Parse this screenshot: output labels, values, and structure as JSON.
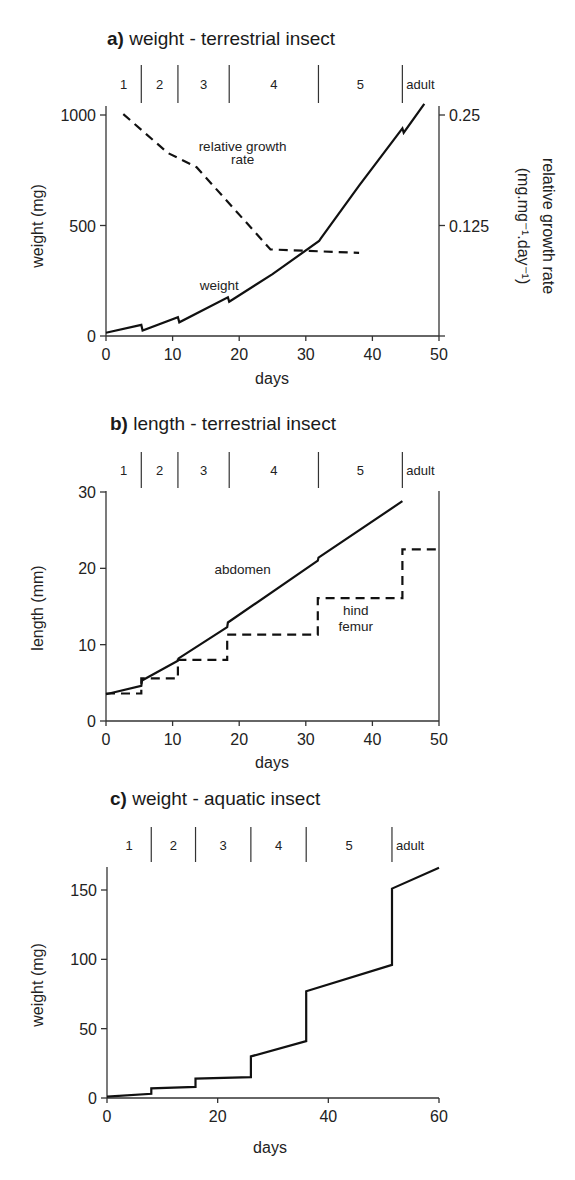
{
  "chart_data": [
    {
      "id": "a",
      "type": "line",
      "title_prefix": "a)",
      "title": "weight - terrestrial insect",
      "xlabel": "days",
      "ylabel": "weight (mg)",
      "ylabel_right": "relative growth rate",
      "ylabel_right_units": "(mg.mg⁻¹.day⁻¹)",
      "xlim": [
        0,
        50
      ],
      "ylim": [
        0,
        1000
      ],
      "ylim_right": [
        0,
        0.25
      ],
      "xticks": [
        0,
        10,
        20,
        30,
        40,
        50
      ],
      "yticks": [
        0,
        500,
        1000
      ],
      "yticks_right": [
        "0.25",
        "0.125"
      ],
      "yticks_right_values": [
        0.25,
        0.125
      ],
      "grid": false,
      "stages": [
        {
          "label": "1",
          "start": 0,
          "end": 5.3
        },
        {
          "label": "2",
          "start": 5.3,
          "end": 10.8
        },
        {
          "label": "3",
          "start": 10.8,
          "end": 18.5
        },
        {
          "label": "4",
          "start": 18.5,
          "end": 31.9
        },
        {
          "label": "5",
          "start": 31.9,
          "end": 44.5
        },
        {
          "label": "adult",
          "start": 44.5,
          "end": 50
        }
      ],
      "series": [
        {
          "name": "weight",
          "style": "solid",
          "axis": "left",
          "points": [
            [
              0,
              15
            ],
            [
              5.3,
              50
            ],
            [
              5.5,
              25
            ],
            [
              10.8,
              85
            ],
            [
              11.0,
              62
            ],
            [
              18.3,
              175
            ],
            [
              18.5,
              155
            ],
            [
              25,
              280
            ],
            [
              32.0,
              430
            ],
            [
              32.2,
              440
            ],
            [
              38,
              680
            ],
            [
              44.5,
              940
            ],
            [
              44.7,
              920
            ],
            [
              47.8,
              1050
            ]
          ]
        },
        {
          "name": "relative growth rate",
          "style": "dashed",
          "axis": "right",
          "points": [
            [
              2.6,
              0.251
            ],
            [
              9.3,
              0.207
            ],
            [
              13.6,
              0.191
            ],
            [
              24.7,
              0.098
            ],
            [
              38,
              0.094
            ]
          ]
        }
      ],
      "annotations": [
        {
          "text": "relative growth",
          "x": 20.5,
          "y": 835
        },
        {
          "text": "rate",
          "x": 20.5,
          "y": 780
        },
        {
          "text": "weight",
          "x": 17,
          "y": 210
        }
      ]
    },
    {
      "id": "b",
      "type": "line",
      "title_prefix": "b)",
      "title": "length - terrestrial insect",
      "xlabel": "days",
      "ylabel": "length (mm)",
      "xlim": [
        0,
        50
      ],
      "ylim": [
        0,
        30
      ],
      "xticks": [
        0,
        10,
        20,
        30,
        40,
        50
      ],
      "yticks": [
        0,
        10,
        20,
        30
      ],
      "grid": false,
      "stages": [
        {
          "label": "1",
          "start": 0,
          "end": 5.3
        },
        {
          "label": "2",
          "start": 5.3,
          "end": 10.8
        },
        {
          "label": "3",
          "start": 10.8,
          "end": 18.5
        },
        {
          "label": "4",
          "start": 18.5,
          "end": 31.9
        },
        {
          "label": "5",
          "start": 31.9,
          "end": 44.5
        },
        {
          "label": "adult",
          "start": 44.5,
          "end": 50
        }
      ],
      "series": [
        {
          "name": "abdomen",
          "style": "solid",
          "points": [
            [
              0,
              3.5
            ],
            [
              5.3,
              4.6
            ],
            [
              5.4,
              5.3
            ],
            [
              10.8,
              7.9
            ],
            [
              10.9,
              8.2
            ],
            [
              18.2,
              12.3
            ],
            [
              18.3,
              12.9
            ],
            [
              31.8,
              21.0
            ],
            [
              31.9,
              21.4
            ],
            [
              44.5,
              28.8
            ]
          ]
        },
        {
          "name": "hind femur",
          "style": "dashed",
          "points": [
            [
              0,
              3.6
            ],
            [
              4.6,
              3.6
            ],
            [
              5.3,
              3.6
            ],
            [
              5.3,
              5.6
            ],
            [
              10.8,
              5.6
            ],
            [
              10.8,
              8.0
            ],
            [
              18.2,
              8.0
            ],
            [
              18.2,
              11.3
            ],
            [
              31.8,
              11.3
            ],
            [
              31.8,
              16.1
            ],
            [
              44.5,
              16.1
            ],
            [
              44.5,
              22.5
            ],
            [
              50,
              22.5
            ]
          ]
        }
      ],
      "annotations": [
        {
          "text": "abdomen",
          "x": 20.5,
          "y": 19.2
        },
        {
          "text": "hind",
          "x": 37.5,
          "y": 13.9
        },
        {
          "text": "femur",
          "x": 37.5,
          "y": 11.8
        }
      ]
    },
    {
      "id": "c",
      "type": "line",
      "title_prefix": "c)",
      "title": "weight - aquatic insect",
      "xlabel": "days",
      "ylabel": "weight (mg)",
      "xlim": [
        0,
        60
      ],
      "ylim": [
        0,
        165
      ],
      "xticks": [
        0,
        20,
        40,
        60
      ],
      "yticks": [
        0,
        50,
        100,
        150
      ],
      "grid": false,
      "stages": [
        {
          "label": "1",
          "start": 0,
          "end": 8
        },
        {
          "label": "2",
          "start": 8,
          "end": 16
        },
        {
          "label": "3",
          "start": 16,
          "end": 26
        },
        {
          "label": "4",
          "start": 26,
          "end": 36
        },
        {
          "label": "5",
          "start": 36,
          "end": 51.5
        },
        {
          "label": "adult",
          "start": 51.5,
          "end": 60
        }
      ],
      "series": [
        {
          "name": "weight",
          "style": "solid",
          "points": [
            [
              0,
              1
            ],
            [
              8,
              3
            ],
            [
              8,
              7
            ],
            [
              16,
              8
            ],
            [
              16,
              14
            ],
            [
              26,
              15
            ],
            [
              26,
              30
            ],
            [
              36,
              41
            ],
            [
              36,
              77
            ],
            [
              51.5,
              96
            ],
            [
              51.5,
              151
            ],
            [
              60,
              166
            ]
          ]
        }
      ],
      "annotations": []
    }
  ]
}
